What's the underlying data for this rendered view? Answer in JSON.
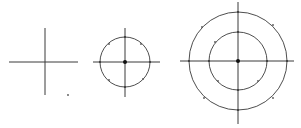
{
  "diagram": {
    "stroke_color": "#3a3a3a",
    "background": "#ffffff",
    "figures": [
      {
        "name": "cross",
        "center": [
          45,
          62
        ],
        "h_line": [
          9,
          78
        ],
        "v_line": [
          28,
          95
        ],
        "circles": [],
        "marks": [
          [
            68,
            95
          ]
        ]
      },
      {
        "name": "cross-with-circle",
        "center": [
          125,
          62
        ],
        "h_line": [
          93,
          160
        ],
        "v_line": [
          28,
          97
        ],
        "circles": [
          25
        ],
        "center_dot": true,
        "marks": [
          [
            109,
            44
          ],
          [
            141,
            44
          ],
          [
            109,
            80
          ],
          [
            143,
            79
          ]
        ]
      },
      {
        "name": "cross-with-two-circles",
        "center": [
          238,
          61
        ],
        "h_line": [
          180,
          294
        ],
        "v_line": [
          2,
          124
        ],
        "circles": [
          29,
          49
        ],
        "center_dot": true,
        "marks": [
          [
            215,
            42
          ],
          [
            218,
            81
          ],
          [
            258,
            81
          ],
          [
            202,
            27
          ],
          [
            273,
            25
          ],
          [
            204,
            98
          ],
          [
            273,
            98
          ]
        ]
      }
    ]
  }
}
